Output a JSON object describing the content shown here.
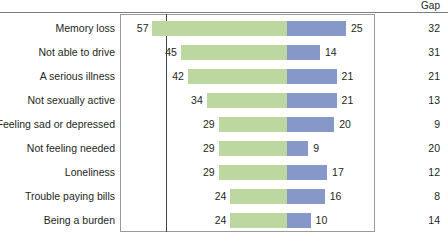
{
  "header": {
    "gap_label": "Gap"
  },
  "chart_data": {
    "type": "bar",
    "title": "",
    "subtitle": "",
    "xlabel": "",
    "ylabel": "",
    "orientation": "horizontal",
    "layout": "diverging-paired-bars",
    "grid": false,
    "legend_position": "none",
    "zero_axis_x_units": 0,
    "px_per_unit": 2.36,
    "categories": [
      "Memory loss",
      "Not able to drive",
      "A serious illness",
      "Not sexually active",
      "Feeling sad or depressed",
      "Not feeling needed",
      "Loneliness",
      "Trouble paying bills",
      "Being a burden"
    ],
    "series": [
      {
        "name": "left",
        "color": "#bdd7a0",
        "direction": "left",
        "values": [
          57,
          45,
          42,
          34,
          29,
          29,
          29,
          24,
          24
        ]
      },
      {
        "name": "right",
        "color": "#8698c8",
        "direction": "right",
        "values": [
          25,
          14,
          21,
          21,
          20,
          9,
          17,
          16,
          10
        ]
      }
    ],
    "gap_column": {
      "label": "Gap",
      "values": [
        32,
        31,
        21,
        13,
        9,
        20,
        12,
        8,
        14
      ]
    },
    "rows": [
      {
        "label": "Memory loss",
        "left": 57,
        "right": 25,
        "gap": 32
      },
      {
        "label": "Not able to drive",
        "left": 45,
        "right": 14,
        "gap": 31
      },
      {
        "label": "A serious illness",
        "left": 42,
        "right": 21,
        "gap": 21
      },
      {
        "label": "Not sexually active",
        "left": 34,
        "right": 21,
        "gap": 13
      },
      {
        "label": "Feeling sad or depressed",
        "left": 29,
        "right": 20,
        "gap": 9
      },
      {
        "label": "Not feeling needed",
        "left": 29,
        "right": 9,
        "gap": 20
      },
      {
        "label": "Loneliness",
        "left": 29,
        "right": 17,
        "gap": 12
      },
      {
        "label": "Trouble paying bills",
        "left": 24,
        "right": 16,
        "gap": 8
      },
      {
        "label": "Being a burden",
        "left": 24,
        "right": 10,
        "gap": 14
      }
    ]
  },
  "colors": {
    "left_bar": "#bdd7a0",
    "right_bar": "#8698c8",
    "frame": "#9a9a9a",
    "zero_line": "#3c4340",
    "rule": "#7d7d7d",
    "text": "#231f20"
  }
}
